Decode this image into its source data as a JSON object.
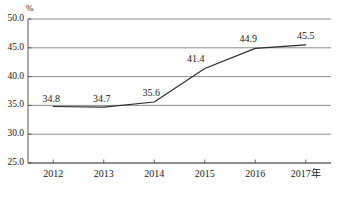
{
  "chart_data": {
    "type": "line",
    "title": "",
    "subtitle": "",
    "xlabel": "",
    "ylabel": "",
    "unit_label": "%",
    "categories": [
      "2012",
      "2013",
      "2014",
      "2015",
      "2016",
      "2017年"
    ],
    "values": [
      34.8,
      34.7,
      35.6,
      41.4,
      44.9,
      45.5
    ],
    "point_labels": [
      "34.8",
      "34.7",
      "35.6",
      "41.4",
      "44.9",
      "45.5"
    ],
    "series": [
      {
        "name": "",
        "values": [
          34.8,
          34.7,
          35.6,
          41.4,
          44.9,
          45.5
        ]
      }
    ],
    "ylim": [
      25.0,
      50.0
    ],
    "yticks": [
      25.0,
      30.0,
      35.0,
      40.0,
      45.0,
      50.0
    ],
    "ytick_labels": [
      "25.0",
      "30.0",
      "35.0",
      "40.0",
      "45.0",
      "50.0"
    ],
    "xtick_labels": [
      "2012",
      "2013",
      "2014",
      "2015",
      "2016",
      "2017年"
    ],
    "grid": true,
    "grid_axis": "y",
    "legend": false,
    "legend_position": "none",
    "markers": false,
    "line_color": "#2b2b2b",
    "grid_color": "#808080",
    "axis_color": "#555555",
    "background_color": "#ffffff",
    "annotations": []
  },
  "geometry": {
    "plot_left": 28,
    "plot_right": 331,
    "plot_top": 19,
    "plot_bottom": 163
  }
}
